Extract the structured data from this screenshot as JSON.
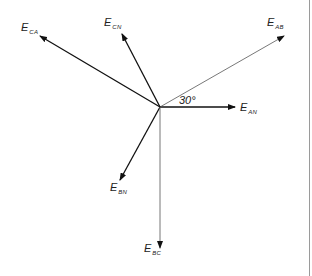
{
  "diagram": {
    "type": "phasor-diagram",
    "origin": [
      160,
      107
    ],
    "phasors": [
      {
        "id": "EAN",
        "main": "E",
        "sub": "AN",
        "end": [
          235,
          107
        ],
        "color": "#111111",
        "width": 1.3
      },
      {
        "id": "EAB",
        "main": "E",
        "sub": "AB",
        "end": [
          284,
          36
        ],
        "color": "#555555",
        "width": 0.8
      },
      {
        "id": "ECN",
        "main": "E",
        "sub": "CN",
        "end": [
          122,
          34
        ],
        "color": "#111111",
        "width": 1.3
      },
      {
        "id": "ECA",
        "main": "E",
        "sub": "CA",
        "end": [
          40,
          36
        ],
        "color": "#111111",
        "width": 1.3
      },
      {
        "id": "EBN",
        "main": "E",
        "sub": "BN",
        "end": [
          120,
          180
        ],
        "color": "#111111",
        "width": 1.3
      },
      {
        "id": "EBC",
        "main": "E",
        "sub": "BC",
        "end": [
          160,
          248
        ],
        "color": "#666666",
        "width": 0.9
      }
    ],
    "angle_label": "30°"
  }
}
